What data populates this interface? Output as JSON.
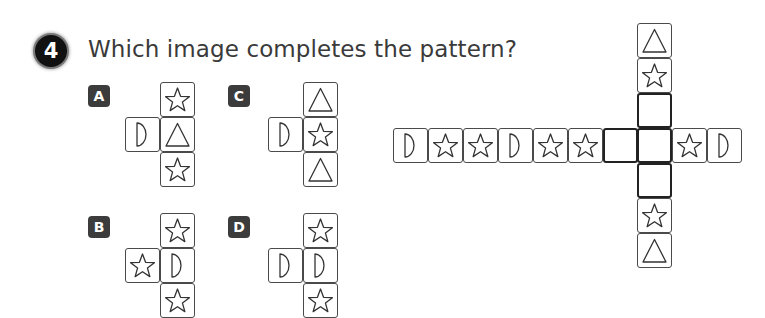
{
  "question": {
    "number": "4",
    "text": "Which image completes the pattern?"
  },
  "options": [
    {
      "label": "A",
      "badge": {
        "x": 88,
        "y": 85
      },
      "cells": [
        {
          "x": 160,
          "y": 82,
          "shape": "star"
        },
        {
          "x": 125,
          "y": 117,
          "shape": "half-circle"
        },
        {
          "x": 160,
          "y": 117,
          "shape": "triangle"
        },
        {
          "x": 160,
          "y": 152,
          "shape": "star"
        }
      ]
    },
    {
      "label": "B",
      "badge": {
        "x": 88,
        "y": 216
      },
      "cells": [
        {
          "x": 160,
          "y": 213,
          "shape": "star"
        },
        {
          "x": 125,
          "y": 248,
          "shape": "star"
        },
        {
          "x": 160,
          "y": 248,
          "shape": "half-circle"
        },
        {
          "x": 160,
          "y": 283,
          "shape": "star"
        }
      ]
    },
    {
      "label": "C",
      "badge": {
        "x": 228,
        "y": 85
      },
      "cells": [
        {
          "x": 303,
          "y": 82,
          "shape": "triangle"
        },
        {
          "x": 268,
          "y": 117,
          "shape": "half-circle"
        },
        {
          "x": 303,
          "y": 117,
          "shape": "star"
        },
        {
          "x": 303,
          "y": 152,
          "shape": "triangle"
        }
      ]
    },
    {
      "label": "D",
      "badge": {
        "x": 228,
        "y": 216
      },
      "cells": [
        {
          "x": 303,
          "y": 213,
          "shape": "star"
        },
        {
          "x": 268,
          "y": 248,
          "shape": "half-circle"
        },
        {
          "x": 303,
          "y": 248,
          "shape": "half-circle"
        },
        {
          "x": 303,
          "y": 283,
          "shape": "star"
        }
      ]
    }
  ],
  "pattern": {
    "row": [
      {
        "x": 393,
        "y": 128,
        "shape": "half-circle"
      },
      {
        "x": 428,
        "y": 128,
        "shape": "star"
      },
      {
        "x": 463,
        "y": 128,
        "shape": "star"
      },
      {
        "x": 498,
        "y": 128,
        "shape": "half-circle"
      },
      {
        "x": 533,
        "y": 128,
        "shape": "star"
      },
      {
        "x": 568,
        "y": 128,
        "shape": "star"
      },
      {
        "x": 603,
        "y": 128,
        "shape": "blank"
      },
      {
        "x": 637,
        "y": 128,
        "shape": "blank"
      },
      {
        "x": 672,
        "y": 128,
        "shape": "star"
      },
      {
        "x": 707,
        "y": 128,
        "shape": "half-circle"
      }
    ],
    "column": [
      {
        "x": 637,
        "y": 23,
        "shape": "triangle"
      },
      {
        "x": 637,
        "y": 58,
        "shape": "star"
      },
      {
        "x": 637,
        "y": 93,
        "shape": "blank"
      },
      {
        "x": 637,
        "y": 163,
        "shape": "blank"
      },
      {
        "x": 637,
        "y": 198,
        "shape": "star"
      },
      {
        "x": 637,
        "y": 233,
        "shape": "triangle"
      }
    ]
  }
}
